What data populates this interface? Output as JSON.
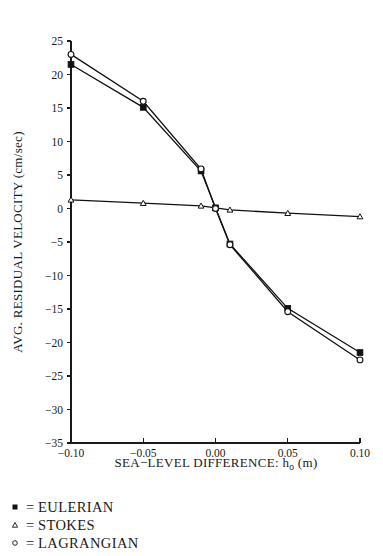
{
  "chart_data": {
    "type": "line",
    "title": "",
    "xlabel": "SEA−LEVEL DIFFERENCE: h",
    "xlabel_sub": "o",
    "xlabel_unit": " (m)",
    "ylabel": "AVG. RESIDUAL VELOCITY (cm/sec)",
    "xlim": [
      -0.1,
      0.1
    ],
    "ylim": [
      -35,
      25
    ],
    "xticks": [
      -0.1,
      -0.05,
      0.0,
      0.05,
      0.1
    ],
    "xticklabels": [
      "−0.10",
      "−0.05",
      "0.00",
      "0.05",
      "0.10"
    ],
    "yticks": [
      25,
      20,
      15,
      10,
      5,
      0,
      -5,
      -10,
      -15,
      -20,
      -25,
      -30,
      -35
    ],
    "yticklabels": [
      "25",
      "20",
      "15",
      "10",
      "5",
      "0",
      "−5",
      "−10",
      "−15",
      "−20",
      "−25",
      "−30",
      "−35"
    ],
    "grid": false,
    "legend_position": "below-axes",
    "series": [
      {
        "name": "EULERIAN",
        "marker": "filled-square",
        "x": [
          -0.1,
          -0.05,
          -0.01,
          0.0,
          0.01,
          0.05,
          0.1
        ],
        "y": [
          21.5,
          15.1,
          5.6,
          0.1,
          -5.3,
          -14.9,
          -21.5
        ]
      },
      {
        "name": "STOKES",
        "marker": "open-triangle",
        "x": [
          -0.1,
          -0.05,
          -0.01,
          0.01,
          0.05,
          0.1
        ],
        "y": [
          1.3,
          0.8,
          0.4,
          -0.2,
          -0.7,
          -1.2
        ]
      },
      {
        "name": "LAGRANGIAN",
        "marker": "open-circle",
        "x": [
          -0.1,
          -0.05,
          -0.01,
          0.0,
          0.01,
          0.05,
          0.1
        ],
        "y": [
          23.0,
          16.0,
          5.9,
          0.0,
          -5.4,
          -15.4,
          -22.6
        ]
      }
    ]
  },
  "legend": {
    "rows": [
      {
        "equals": "=",
        "label": "EULERIAN",
        "marker": "filled-square"
      },
      {
        "equals": "=",
        "label": "STOKES",
        "marker": "open-triangle"
      },
      {
        "equals": "=",
        "label": "LAGRANGIAN",
        "marker": "open-circle"
      }
    ]
  },
  "colors": {
    "ink": "#1a1a1a",
    "line": "#111111",
    "background": "#ffffff"
  }
}
